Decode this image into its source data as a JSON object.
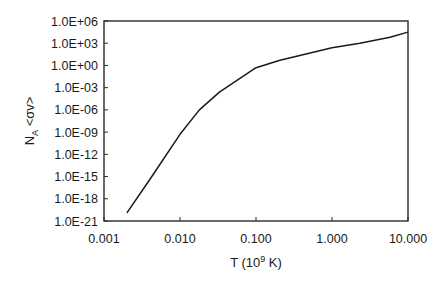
{
  "chart_data": {
    "type": "line",
    "title": "",
    "xlabel": "T (10^9 K)",
    "xlabel_parts": {
      "main": "T (10",
      "sup": "9",
      "tail": " K)"
    },
    "ylabel": "N_A <σv>",
    "ylabel_parts": {
      "main": "N",
      "sub": "A",
      "tail": " <σv>"
    },
    "x_scale": "log",
    "y_scale": "log",
    "xlim": [
      0.001,
      10.0
    ],
    "ylim": [
      1e-21,
      1000000.0
    ],
    "x_ticks": [
      "0.001",
      "0.010",
      "0.100",
      "1.000",
      "10.000"
    ],
    "x_tick_values": [
      0.001,
      0.01,
      0.1,
      1.0,
      10.0
    ],
    "y_ticks": [
      "1.0E+06",
      "1.0E+03",
      "1.0E+00",
      "1.0E-03",
      "1.0E-06",
      "1.0E-09",
      "1.0E-12",
      "1.0E-15",
      "1.0E-18",
      "1.0E-21"
    ],
    "y_tick_exponents": [
      6,
      3,
      0,
      -3,
      -6,
      -9,
      -12,
      -15,
      -18,
      -21
    ],
    "grid": false,
    "legend": null,
    "series": [
      {
        "name": "N_A <σv>",
        "color": "#1a1a1a",
        "x": [
          0.002,
          0.004,
          0.01,
          0.018,
          0.033,
          0.1,
          0.207,
          1.0,
          2.33,
          5.8,
          10.0
        ],
        "y": [
          1.3e-20,
          4e-16,
          5e-10,
          1e-06,
          0.00025,
          0.5,
          5.0,
          250,
          1000,
          6300,
          32000
        ],
        "log10_y": [
          -19.9,
          -15.4,
          -9.3,
          -6.0,
          -3.6,
          -0.3,
          0.7,
          2.4,
          3.0,
          3.8,
          4.5
        ]
      }
    ]
  },
  "colors": {
    "axis": "#2a2a2a",
    "line": "#1a1a1a",
    "background": "#ffffff"
  }
}
